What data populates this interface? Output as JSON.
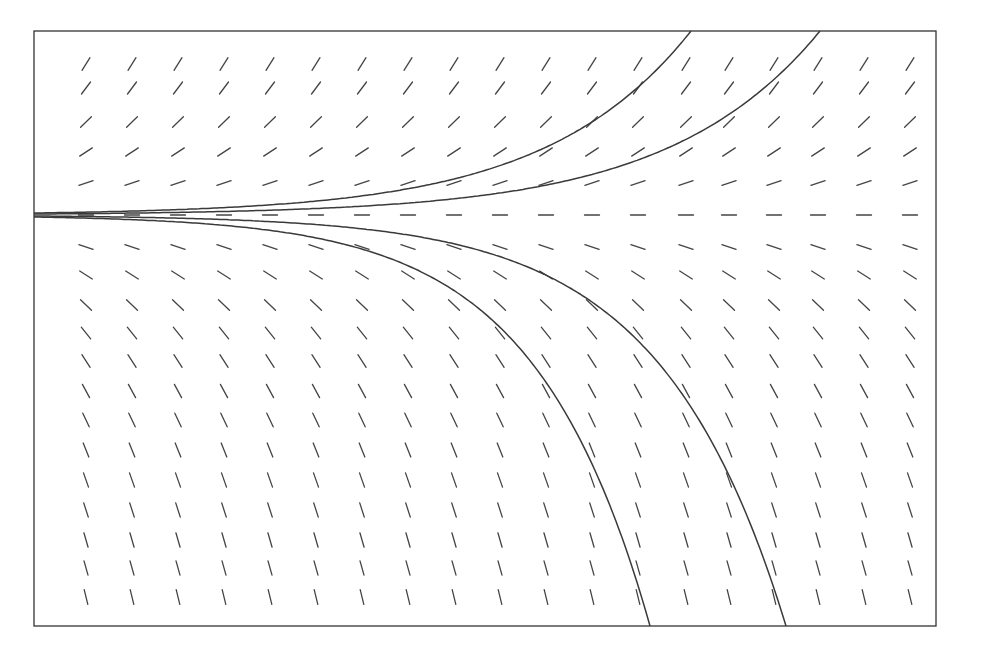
{
  "chart_data": {
    "type": "slope_field",
    "title": "",
    "xlabel": "",
    "ylabel": "",
    "grid": false,
    "legend": null,
    "frame_px": {
      "left": 34,
      "top": 31,
      "right": 936,
      "bottom": 626
    },
    "equilibrium_row_px": 215,
    "slope_field": {
      "columns_px": [
        86,
        132,
        178,
        224,
        270,
        316,
        362,
        408,
        454,
        500,
        546,
        592,
        638,
        686,
        729,
        774,
        818,
        864,
        910
      ],
      "rows_px": [
        64,
        88,
        122,
        152,
        183,
        215,
        247,
        275,
        305,
        333,
        361,
        391,
        420,
        450,
        480,
        510,
        540,
        568,
        597
      ],
      "segment_length_px": 15,
      "slope_rule": "slope proportional to vertical distance from equilibrium row (dy/dt = k*y)",
      "slope_gain": 0.0105
    },
    "solution_curves": [
      {
        "name": "upper-outer",
        "start_px": [
          34,
          213
        ],
        "exit_px": [
          691,
          31
        ],
        "direction": "up"
      },
      {
        "name": "upper-inner",
        "start_px": [
          34,
          214
        ],
        "exit_px": [
          820,
          31
        ],
        "direction": "up"
      },
      {
        "name": "lower-inner",
        "start_px": [
          34,
          216
        ],
        "exit_px": [
          786,
          626
        ],
        "direction": "down"
      },
      {
        "name": "lower-outer",
        "start_px": [
          34,
          217
        ],
        "exit_px": [
          650,
          626
        ],
        "direction": "down"
      }
    ]
  },
  "caption": ""
}
